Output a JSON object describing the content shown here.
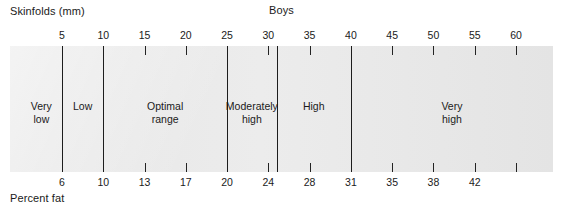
{
  "chart_data": {
    "type": "bar",
    "title": "Boys",
    "xlabel": "Skinfolds (mm)",
    "x2label": "Percent fat",
    "ylabel": "",
    "grid": false,
    "legend": "none",
    "orientation": "horizontal-band",
    "axis_top": {
      "name": "Skinfolds (mm)",
      "unit": "mm",
      "ticks": [
        5,
        10,
        15,
        20,
        25,
        30,
        35,
        40,
        45,
        50,
        55,
        60
      ],
      "tick_labels": [
        "5",
        "10",
        "15",
        "20",
        "25",
        "30",
        "35",
        "40",
        "45",
        "50",
        "55",
        "60"
      ],
      "range": [
        0,
        65
      ]
    },
    "axis_bottom": {
      "name": "Percent fat",
      "unit": "%",
      "tick_labels": [
        "6",
        "10",
        "13",
        "17",
        "20",
        "24",
        "28",
        "31",
        "35",
        "38",
        "42"
      ],
      "values": [
        6,
        10,
        13,
        17,
        20,
        24,
        28,
        31,
        35,
        38,
        42
      ],
      "aligned_to_top_ticks": [
        5,
        10,
        15,
        20,
        25,
        30,
        35,
        40,
        45,
        50,
        55
      ]
    },
    "categories": [
      {
        "label": "Very low",
        "skinfold_min": 0,
        "skinfold_max": 5,
        "percent_fat_max": 6
      },
      {
        "label": "Low",
        "skinfold_min": 5,
        "skinfold_max": 10,
        "percent_fat_min": 6,
        "percent_fat_max": 10
      },
      {
        "label": "Optimal range",
        "skinfold_min": 10,
        "skinfold_max": 25,
        "percent_fat_min": 10,
        "percent_fat_max": 20
      },
      {
        "label": "Moderately high",
        "skinfold_min": 25,
        "skinfold_max": 31,
        "percent_fat_min": 20,
        "percent_fat_max": 25
      },
      {
        "label": "High",
        "skinfold_min": 31,
        "skinfold_max": 40,
        "percent_fat_min": 25,
        "percent_fat_max": 31
      },
      {
        "label": "Very high",
        "skinfold_min": 40,
        "skinfold_max": 65,
        "percent_fat_min": 31
      }
    ],
    "divider_positions_mm": [
      5,
      10,
      25,
      31,
      40
    ],
    "colors": {
      "panel": "#e9e9e9",
      "line": "#1d1d1d",
      "text": "#1a1a1a",
      "background": "#ffffff"
    }
  },
  "labels": {
    "top_left": "Skinfolds (mm)",
    "title": "Boys",
    "bottom_left": "Percent fat"
  },
  "bands": {
    "very_low": "Very\nlow",
    "low": "Low",
    "optimal_range": "Optimal\nrange",
    "moderately_high": "Moderately\nhigh",
    "high": "High",
    "very_high": "Very\nhigh"
  }
}
